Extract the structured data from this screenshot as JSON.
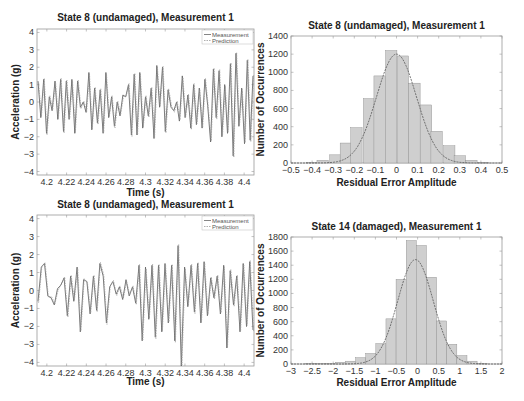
{
  "colors": {
    "axis": "#9a9a9a",
    "measurement": "#666666",
    "prediction": "#9a9a9a",
    "bar_fill": "#cfcfcf",
    "bar_edge": "#8a8a8a",
    "fit": "#555555"
  },
  "chart_data": [
    {
      "id": "ts_top",
      "type": "line",
      "title": "State 8 (undamaged), Measurement 1",
      "xlabel": "Time (s)",
      "ylabel": "Acceleration (g)",
      "xlim": [
        4.19,
        4.41
      ],
      "ylim": [
        -4.2,
        4.2
      ],
      "xticks": [
        4.2,
        4.22,
        4.24,
        4.26,
        4.28,
        4.3,
        4.32,
        4.34,
        4.36,
        4.38,
        4.4
      ],
      "xtick_labels": [
        "4.2",
        "4.22",
        "4.24",
        "4.26",
        "4.28",
        "4.3",
        "4.32",
        "4.34",
        "4.36",
        "4.38",
        "4.4"
      ],
      "yticks": [
        4,
        3,
        2,
        1,
        0,
        -1,
        -2,
        -3,
        -4
      ],
      "ytick_labels": [
        "4",
        "3",
        "2",
        "1",
        "0",
        "−1",
        "−2",
        "−3",
        "−4"
      ],
      "legend": [
        "Measurement",
        "Prediction"
      ],
      "legend_position": "upper right",
      "series": [
        {
          "name": "Measurement",
          "x": [
            4.19,
            4.192,
            4.194,
            4.196,
            4.198,
            4.2,
            4.202,
            4.204,
            4.206,
            4.208,
            4.21,
            4.212,
            4.214,
            4.216,
            4.218,
            4.22,
            4.222,
            4.224,
            4.226,
            4.228,
            4.23,
            4.232,
            4.234,
            4.236,
            4.238,
            4.24,
            4.242,
            4.244,
            4.246,
            4.248,
            4.25,
            4.252,
            4.254,
            4.256,
            4.258,
            4.26,
            4.262,
            4.264,
            4.266,
            4.268,
            4.27,
            4.272,
            4.274,
            4.276,
            4.278,
            4.28,
            4.282,
            4.284,
            4.286,
            4.288,
            4.29,
            4.292,
            4.294,
            4.296,
            4.298,
            4.3,
            4.302,
            4.304,
            4.306,
            4.308,
            4.31,
            4.312,
            4.314,
            4.316,
            4.318,
            4.32,
            4.322,
            4.324,
            4.326,
            4.328,
            4.33,
            4.332,
            4.334,
            4.336,
            4.338,
            4.34,
            4.342,
            4.344,
            4.346,
            4.348,
            4.35,
            4.352,
            4.354,
            4.356,
            4.358,
            4.36,
            4.362,
            4.364,
            4.366,
            4.368,
            4.37,
            4.372,
            4.374,
            4.376,
            4.378,
            4.38,
            4.382,
            4.384,
            4.386,
            4.388,
            4.39,
            4.392,
            4.394,
            4.396,
            4.398,
            4.4,
            4.402,
            4.404,
            4.406,
            4.408,
            4.41
          ],
          "y": [
            1.2,
            -0.9,
            1.3,
            -1.8,
            0.3,
            -0.5,
            1.2,
            -1.0,
            1.3,
            -1.7,
            1.2,
            -1.0,
            1.3,
            -1.8,
            1.2,
            -0.3,
            0.0,
            -0.6,
            1.7,
            -1.6,
            0.8,
            -1.2,
            0.7,
            -1.8,
            1.7,
            -0.9,
            0.3,
            -1.4,
            0.0,
            -0.8,
            0.4,
            0.3,
            1.0,
            -1.9,
            1.6,
            -1.9,
            1.7,
            -1.5,
            0.3,
            -0.8,
            0.8,
            -2.1,
            2.1,
            -0.3,
            2.0,
            -1.7,
            0.7,
            -0.3,
            -0.5,
            0.0,
            -1.1,
            1.5,
            -0.9,
            0.4,
            -1.5,
            1.0,
            -1.3,
            0.8,
            -1.5,
            1.3,
            -0.2,
            -2.3,
            1.9,
            -0.9,
            1.8,
            -2.0,
            1.0,
            -1.8,
            2.2,
            -3.1,
            2.8,
            -1.4,
            0.8,
            -2.4,
            2.4,
            -2.2,
            1.5
          ]
        },
        {
          "name": "Prediction",
          "note": "closely overlaps measurement"
        }
      ]
    },
    {
      "id": "hist_top",
      "type": "bar",
      "title": "State 8 (undamaged), Measurement 1",
      "xlabel": "Residual Error Amplitude",
      "ylabel": "Number of Occurrences",
      "xlim": [
        -0.5,
        0.5
      ],
      "ylim": [
        0,
        1400
      ],
      "xticks": [
        -0.5,
        -0.4,
        -0.3,
        -0.2,
        -0.1,
        0,
        0.1,
        0.2,
        0.3,
        0.4,
        0.5
      ],
      "xtick_labels": [
        "−0.5",
        "−0.4",
        "−0.3",
        "−0.2",
        "−0.1",
        "0",
        "0.1",
        "0.2",
        "0.3",
        "0.4",
        "0.5"
      ],
      "yticks": [
        0,
        200,
        400,
        600,
        800,
        1000,
        1200,
        1400
      ],
      "ytick_labels": [
        "0",
        "200",
        "400",
        "600",
        "800",
        "1000",
        "1200",
        "1400"
      ],
      "bin_width": 0.054,
      "bin_centers": [
        -0.4,
        -0.35,
        -0.29,
        -0.24,
        -0.19,
        -0.13,
        -0.08,
        -0.025,
        0.03,
        0.085,
        0.14,
        0.19,
        0.25,
        0.3,
        0.355,
        0.41
      ],
      "values": [
        5,
        30,
        90,
        220,
        390,
        710,
        960,
        1240,
        1180,
        880,
        640,
        350,
        190,
        80,
        30,
        5
      ],
      "fit": {
        "type": "normal",
        "mean": 0.0,
        "peak": 1200,
        "sigma": 0.095
      }
    },
    {
      "id": "ts_bottom",
      "type": "line",
      "title": "State 8 (undamaged), Measurement 1",
      "xlabel": "Time (s)",
      "ylabel": "Acceleration (g)",
      "xlim": [
        4.19,
        4.41
      ],
      "ylim": [
        -4.2,
        4.2
      ],
      "xticks": [
        4.2,
        4.22,
        4.24,
        4.26,
        4.28,
        4.3,
        4.32,
        4.34,
        4.36,
        4.38,
        4.4
      ],
      "xtick_labels": [
        "4.2",
        "4.22",
        "4.24",
        "4.26",
        "4.28",
        "4.3",
        "4.32",
        "4.34",
        "4.36",
        "4.38",
        "4.4"
      ],
      "yticks": [
        4,
        3,
        2,
        1,
        0,
        -1,
        -2,
        -3,
        -4
      ],
      "ytick_labels": [
        "4",
        "3",
        "2",
        "1",
        "0",
        "−1",
        "−2",
        "−3",
        "−4"
      ],
      "legend": [
        "Measurement",
        "Prediction"
      ],
      "legend_position": "upper right",
      "series": [
        {
          "name": "Measurement",
          "y": [
            -0.6,
            1.3,
            1.5,
            -0.3,
            -0.4,
            -0.8,
            0.1,
            0.3,
            0.7,
            -1.4,
            0.8,
            -0.6,
            1.3,
            -2.3,
            0.6,
            0.5,
            -1.3,
            0.8,
            -1.1,
            1.5,
            0.8,
            -1.8,
            0.2,
            0.5,
            -0.2,
            0.2,
            -0.5,
            0.6,
            -0.3,
            0.2,
            -0.7,
            1.4,
            -2.8,
            1.3,
            -1.6,
            1.4,
            -2.6,
            1.4,
            -2.3,
            1.5,
            -1.8,
            1.4,
            -2.8,
            2.5,
            -4.2,
            1.3,
            -0.9,
            1.4,
            -1.2,
            1.5,
            -1.8,
            1.6,
            -1.4,
            0.7,
            -0.4,
            0.8,
            -1.3,
            1.4,
            -3.2,
            1.1,
            -0.8,
            0.8,
            -2.3,
            1.5,
            -2.0,
            1.6,
            -2.2
          ]
        },
        {
          "name": "Prediction",
          "note": "dashed, closely overlaps measurement with small offsets"
        }
      ]
    },
    {
      "id": "hist_bottom",
      "type": "bar",
      "title": "State 14 (damaged), Measurement 1",
      "xlabel": "Residual Error Amplitude",
      "ylabel": "Number of Occurrences",
      "xlim": [
        -3,
        2
      ],
      "ylim": [
        0,
        1800
      ],
      "xticks": [
        -3,
        -2.5,
        -2,
        -1.5,
        -1,
        -0.5,
        0,
        0.5,
        1,
        1.5,
        2
      ],
      "xtick_labels": [
        "−3",
        "−2.5",
        "−2",
        "−1.5",
        "−1",
        "−0.5",
        "0",
        "0.5",
        "1",
        "1.5",
        "2"
      ],
      "yticks": [
        0,
        200,
        400,
        600,
        800,
        1000,
        1200,
        1400,
        1600,
        1800
      ],
      "ytick_labels": [
        "0",
        "200",
        "400",
        "600",
        "800",
        "1000",
        "1200",
        "1400",
        "1600",
        "1800"
      ],
      "bin_width": 0.24,
      "bin_centers": [
        -2.55,
        -2.31,
        -2.07,
        -1.83,
        -1.59,
        -1.35,
        -1.11,
        -0.87,
        -0.63,
        -0.39,
        -0.15,
        0.09,
        0.33,
        0.57,
        0.81,
        1.05,
        1.29,
        1.53
      ],
      "values": [
        3,
        5,
        10,
        25,
        40,
        90,
        150,
        290,
        640,
        1200,
        1750,
        1680,
        1230,
        610,
        280,
        120,
        40,
        10
      ],
      "fit": {
        "type": "normal",
        "mean": -0.05,
        "peak": 1480,
        "sigma": 0.42
      }
    }
  ]
}
